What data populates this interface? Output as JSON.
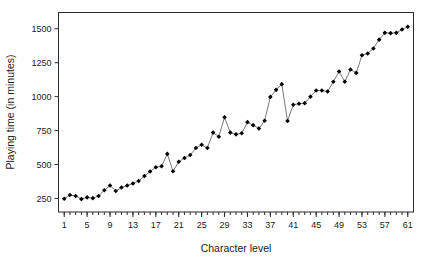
{
  "chart_data": {
    "type": "line",
    "title": "",
    "subtitle": "",
    "xlabel": "Character level",
    "ylabel": "Playing time (in minutes)",
    "xlim": [
      0,
      62
    ],
    "ylim": [
      150,
      1620
    ],
    "grid": false,
    "legend": false,
    "marker": "filled-diamond",
    "line_color": "#555555",
    "marker_color": "#000000",
    "xticks": [
      1,
      5,
      9,
      13,
      17,
      21,
      25,
      29,
      33,
      37,
      41,
      45,
      49,
      53,
      57,
      61
    ],
    "xtick_labels": [
      "1",
      "5",
      "9",
      "13",
      "17",
      "21",
      "25",
      "29",
      "33",
      "37",
      "41",
      "45",
      "49",
      "53",
      "57",
      "61"
    ],
    "minor_xticks_every": 1,
    "yticks": [
      250,
      500,
      750,
      1000,
      1250,
      1500
    ],
    "ytick_labels": [
      "250",
      "500",
      "750",
      "1000",
      "1250",
      "1500"
    ],
    "series": [
      {
        "name": "Playing time",
        "x": [
          1,
          2,
          3,
          4,
          5,
          6,
          7,
          8,
          9,
          10,
          11,
          12,
          13,
          14,
          15,
          16,
          17,
          18,
          19,
          20,
          21,
          22,
          23,
          24,
          25,
          26,
          27,
          28,
          29,
          30,
          31,
          32,
          33,
          34,
          35,
          36,
          37,
          38,
          39,
          40,
          41,
          42,
          43,
          44,
          45,
          46,
          47,
          48,
          49,
          50,
          51,
          52,
          53,
          54,
          55,
          56,
          57,
          58,
          59,
          60,
          61
        ],
        "values": [
          248,
          275,
          268,
          245,
          258,
          252,
          268,
          310,
          345,
          305,
          330,
          345,
          360,
          378,
          415,
          448,
          480,
          487,
          578,
          450,
          520,
          548,
          570,
          622,
          645,
          622,
          735,
          705,
          848,
          735,
          722,
          730,
          812,
          790,
          765,
          822,
          998,
          1050,
          1092,
          820,
          940,
          948,
          952,
          1000,
          1045,
          1045,
          1038,
          1110,
          1185,
          1110,
          1200,
          1175,
          1305,
          1318,
          1355,
          1420,
          1470,
          1468,
          1470,
          1495,
          1515
        ]
      }
    ]
  },
  "axes": {
    "x_title": "Character level",
    "y_title": "Playing time (in minutes)"
  }
}
